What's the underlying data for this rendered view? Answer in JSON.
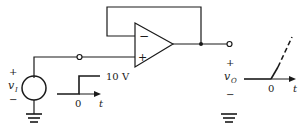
{
  "diagram": {
    "type": "op-amp voltage follower with step input",
    "opamp": {
      "inverting_label": "−",
      "noninverting_label": "+"
    },
    "source": {
      "plus": "+",
      "minus": "−",
      "name": "v",
      "subscript": "I"
    },
    "input_waveform": {
      "level": "10 V",
      "zero": "0",
      "axis": "t"
    },
    "output": {
      "plus": "+",
      "minus": "−",
      "name": "v",
      "subscript": "O"
    },
    "output_waveform": {
      "zero": "0",
      "axis": "t"
    },
    "colors": {
      "ink": "#1a1a1a",
      "background": "#ffffff"
    }
  }
}
